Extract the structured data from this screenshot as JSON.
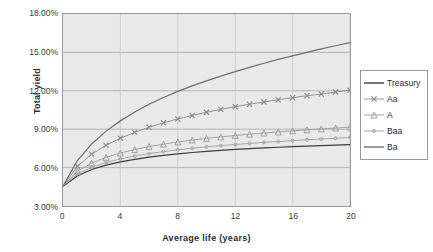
{
  "chart_data": {
    "type": "line",
    "title": "",
    "xlabel": "Average  life (years)",
    "ylabel": "Total yield",
    "xlim": [
      0,
      20
    ],
    "ylim": [
      3.0,
      18.0
    ],
    "xticks": [
      "0",
      "4",
      "8",
      "12",
      "16",
      "20"
    ],
    "yticks": [
      "3.00%",
      "6.00%",
      "9.00%",
      "12.00%",
      "15.00%",
      "18.00%"
    ],
    "grid": true,
    "legend_position": "right",
    "x": [
      0,
      1,
      2,
      3,
      4,
      5,
      6,
      7,
      8,
      9,
      10,
      11,
      12,
      13,
      14,
      15,
      16,
      17,
      18,
      19,
      20
    ],
    "series": [
      {
        "name": "Treasury",
        "marker": "none",
        "color": "#3c3c3c",
        "values": [
          4.55,
          5.35,
          5.85,
          6.2,
          6.45,
          6.65,
          6.82,
          6.96,
          7.08,
          7.18,
          7.27,
          7.35,
          7.42,
          7.48,
          7.54,
          7.59,
          7.64,
          7.68,
          7.72,
          7.76,
          7.8
        ]
      },
      {
        "name": "Aa",
        "marker": "x",
        "color": "#8a8a8a",
        "values": [
          4.55,
          6.1,
          7.05,
          7.75,
          8.3,
          8.75,
          9.15,
          9.5,
          9.8,
          10.07,
          10.32,
          10.55,
          10.76,
          10.95,
          11.13,
          11.3,
          11.46,
          11.61,
          11.75,
          11.9,
          12.05
        ]
      },
      {
        "name": "A",
        "marker": "triangle",
        "color": "#9a9a9a",
        "values": [
          4.55,
          5.72,
          6.35,
          6.8,
          7.14,
          7.41,
          7.64,
          7.83,
          8.0,
          8.15,
          8.28,
          8.4,
          8.51,
          8.61,
          8.7,
          8.79,
          8.87,
          8.95,
          9.02,
          9.09,
          9.16
        ]
      },
      {
        "name": "Baa",
        "marker": "dot",
        "color": "#9e9e9e",
        "values": [
          4.55,
          5.5,
          6.02,
          6.4,
          6.68,
          6.9,
          7.09,
          7.25,
          7.39,
          7.51,
          7.62,
          7.72,
          7.81,
          7.89,
          7.97,
          8.04,
          8.1,
          8.17,
          8.23,
          8.29,
          8.35
        ]
      },
      {
        "name": "Ba",
        "marker": "none",
        "color": "#6e6e6e",
        "values": [
          4.55,
          6.55,
          7.85,
          8.85,
          9.65,
          10.35,
          10.95,
          11.48,
          11.95,
          12.38,
          12.78,
          13.15,
          13.5,
          13.83,
          14.15,
          14.45,
          14.73,
          15.0,
          15.27,
          15.52,
          15.77
        ]
      }
    ]
  },
  "legend": {
    "items": [
      {
        "label": "Treasury"
      },
      {
        "label": "Aa"
      },
      {
        "label": "A"
      },
      {
        "label": "Baa"
      },
      {
        "label": "Ba"
      }
    ]
  }
}
